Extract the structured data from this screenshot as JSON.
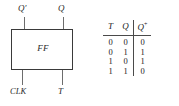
{
  "figure": {
    "schematic": {
      "block_label": "FF",
      "outputs": [
        {
          "name": "q-prime-output",
          "label": "Q′"
        },
        {
          "name": "q-output",
          "label": "Q"
        }
      ],
      "inputs": [
        {
          "name": "clk-input",
          "label": "CLK",
          "edge_triggered": true
        },
        {
          "name": "t-input",
          "label": "T"
        }
      ],
      "colors": {
        "box_stroke": "#3a3a3a",
        "wire_stroke": "#6d6d6d",
        "text": "#2a2a2a",
        "background": "#ffffff"
      }
    },
    "table": {
      "headers": {
        "t": "T",
        "q": "Q",
        "q_next": "Q",
        "q_next_sup": "+"
      },
      "rows": [
        {
          "t": "0",
          "q": "0",
          "q_next": "0"
        },
        {
          "t": "0",
          "q": "1",
          "q_next": "1"
        },
        {
          "t": "1",
          "q": "0",
          "q_next": "1"
        },
        {
          "t": "1",
          "q": "1",
          "q_next": "0"
        }
      ],
      "rule_color": "#4a4a4a"
    }
  }
}
